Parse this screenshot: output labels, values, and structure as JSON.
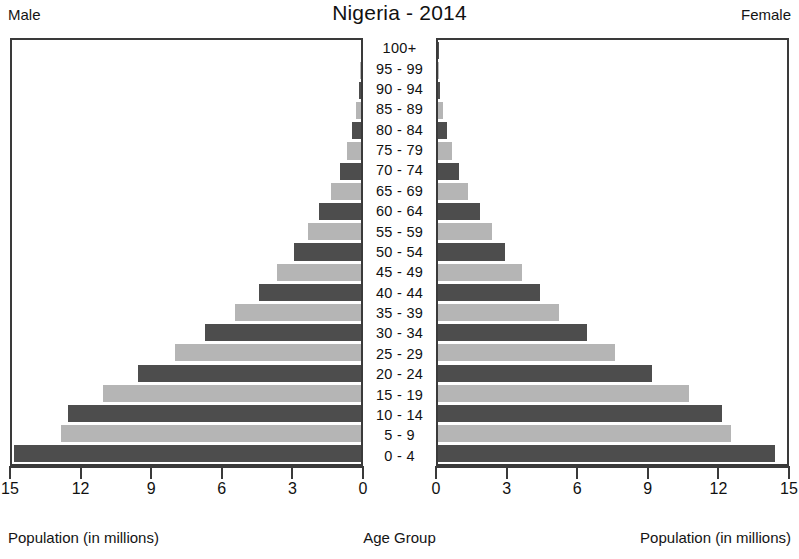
{
  "header": {
    "male_label": "Male",
    "female_label": "Female",
    "title": "Nigeria - 2014"
  },
  "footer": {
    "left_label": "Population (in millions)",
    "center_label": "Age Group",
    "right_label": "Population (in millions)"
  },
  "colors": {
    "bar_dark": "#4d4d4d",
    "bar_light": "#b5b5b5",
    "frame": "#3a3a3a",
    "text": "#111111",
    "background": "#ffffff"
  },
  "chart_data": {
    "type": "bar",
    "chart_style": "population-pyramid",
    "title": "Nigeria - 2014",
    "xlabel": "Population (in millions)",
    "ylabel": "Age Group",
    "xlim": [
      0,
      15
    ],
    "grid": false,
    "legend": "none",
    "left_axis_ticks": [
      "15",
      "12",
      "9",
      "6",
      "3",
      "0"
    ],
    "right_axis_ticks": [
      "0",
      "3",
      "6",
      "9",
      "12",
      "15"
    ],
    "left_axis_tick_values": [
      15,
      12,
      9,
      6,
      3,
      0
    ],
    "right_axis_tick_values": [
      0,
      3,
      6,
      9,
      12,
      15
    ],
    "categories": [
      "100+",
      "95 - 99",
      "90 - 94",
      "85 - 89",
      "80 - 84",
      "75 - 79",
      "70 - 74",
      "65 - 69",
      "60 - 64",
      "55 - 59",
      "50 - 54",
      "45 - 49",
      "40 - 44",
      "35 - 39",
      "30 - 34",
      "25 - 29",
      "20 - 24",
      "15 - 19",
      "10 - 14",
      "5 - 9",
      "0 - 4"
    ],
    "series": [
      {
        "name": "Male",
        "side": "left",
        "values": [
          0.02,
          0.05,
          0.1,
          0.2,
          0.4,
          0.6,
          0.9,
          1.3,
          1.8,
          2.3,
          2.9,
          3.6,
          4.4,
          5.4,
          6.7,
          8.0,
          9.6,
          11.1,
          12.6,
          12.9,
          14.9
        ]
      },
      {
        "name": "Female",
        "side": "right",
        "values": [
          0.02,
          0.05,
          0.1,
          0.2,
          0.4,
          0.6,
          0.9,
          1.3,
          1.8,
          2.3,
          2.9,
          3.6,
          4.4,
          5.2,
          6.4,
          7.6,
          9.2,
          10.8,
          12.2,
          12.6,
          14.5
        ]
      }
    ],
    "bar_colors": [
      "#4d4d4d",
      "#b5b5b5",
      "#4d4d4d",
      "#b5b5b5",
      "#4d4d4d",
      "#b5b5b5",
      "#4d4d4d",
      "#b5b5b5",
      "#4d4d4d",
      "#b5b5b5",
      "#4d4d4d",
      "#b5b5b5",
      "#4d4d4d",
      "#b5b5b5",
      "#4d4d4d",
      "#b5b5b5",
      "#4d4d4d",
      "#b5b5b5",
      "#4d4d4d",
      "#b5b5b5",
      "#4d4d4d"
    ]
  }
}
